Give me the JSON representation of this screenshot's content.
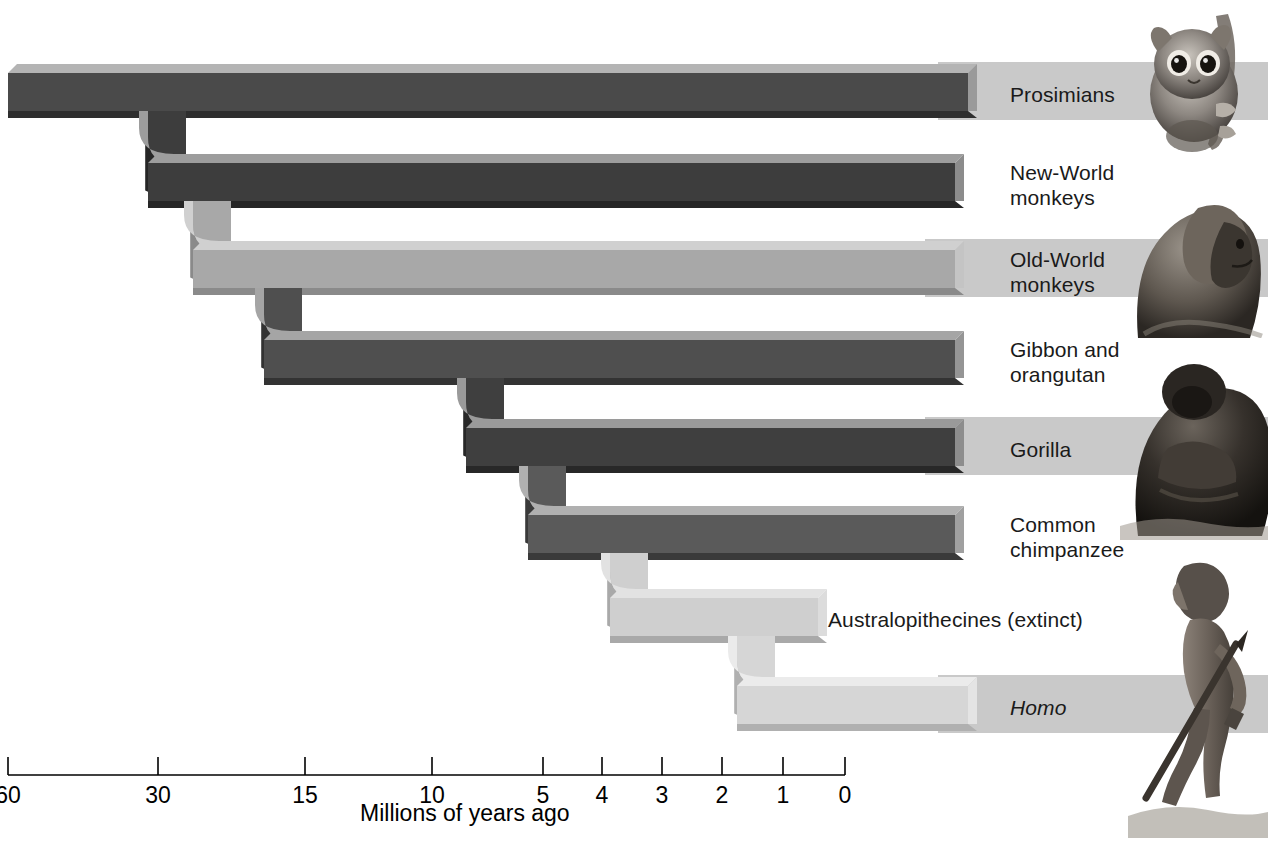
{
  "figure": {
    "axis_title": "Millions of years ago",
    "background": "#ffffff"
  },
  "axis": {
    "label": "Millions of years ago",
    "ticks": [
      {
        "value": "60",
        "x": 8
      },
      {
        "value": "30",
        "x": 158
      },
      {
        "value": "15",
        "x": 305
      },
      {
        "value": "10",
        "x": 432
      },
      {
        "value": "5",
        "x": 543
      },
      {
        "value": "4",
        "x": 602
      },
      {
        "value": "3",
        "x": 662
      },
      {
        "value": "2",
        "x": 722
      },
      {
        "value": "1",
        "x": 783
      },
      {
        "value": "0",
        "x": 845
      }
    ],
    "line_y": 775,
    "tick_top": 757,
    "label_y": 782
  },
  "branches": [
    {
      "id": "prosimians",
      "label": "Prosimians",
      "italic": false,
      "divergence_mya": "60",
      "top": 73,
      "height": 38,
      "start_x": 8,
      "end_x": 968,
      "fill_top": "#b4b4b4",
      "fill_face": "#4a4a4a",
      "fill_bottom": "#2e2e2e",
      "cap": "#9a9a9a",
      "band": true,
      "label_x": 1010,
      "label_y": 82
    },
    {
      "id": "new-world-monkeys",
      "label": "New-World\nmonkeys",
      "italic": false,
      "divergence_mya": "40",
      "top": 163,
      "height": 38,
      "start_x": 148,
      "end_x": 955,
      "fill_top": "#9d9d9d",
      "fill_face": "#3d3d3d",
      "fill_bottom": "#262626",
      "cap": "#8c8c8c",
      "band": false,
      "label_x": 1010,
      "label_y": 160
    },
    {
      "id": "old-world-monkeys",
      "label": "Old-World\nmonkeys",
      "italic": false,
      "divergence_mya": "35",
      "top": 250,
      "height": 38,
      "start_x": 193,
      "end_x": 955,
      "fill_top": "#d0d0d0",
      "fill_face": "#a8a8a8",
      "fill_bottom": "#8a8a8a",
      "cap": "#c4c4c4",
      "band": true,
      "label_x": 1010,
      "label_y": 247
    },
    {
      "id": "gibbon-orangutan",
      "label": "Gibbon and\norangutan",
      "italic": false,
      "divergence_mya": "20",
      "top": 340,
      "height": 38,
      "start_x": 264,
      "end_x": 955,
      "fill_top": "#a5a5a5",
      "fill_face": "#4f4f4f",
      "fill_bottom": "#333333",
      "cap": "#959595",
      "band": false,
      "label_x": 1010,
      "label_y": 337
    },
    {
      "id": "gorilla",
      "label": "Gorilla",
      "italic": false,
      "divergence_mya": "8",
      "top": 428,
      "height": 38,
      "start_x": 466,
      "end_x": 955,
      "fill_top": "#9a9a9a",
      "fill_face": "#3f3f3f",
      "fill_bottom": "#282828",
      "cap": "#8d8d8d",
      "band": true,
      "label_x": 1010,
      "label_y": 437
    },
    {
      "id": "common-chimpanzee",
      "label": "Common\nchimpanzee",
      "italic": false,
      "divergence_mya": "6",
      "top": 515,
      "height": 38,
      "start_x": 528,
      "end_x": 955,
      "fill_top": "#b0b0b0",
      "fill_face": "#5a5a5a",
      "fill_bottom": "#3a3a3a",
      "cap": "#a0a0a0",
      "band": false,
      "label_x": 1010,
      "label_y": 512
    },
    {
      "id": "australopithecines",
      "label": "Australopithecines (extinct)",
      "italic": false,
      "divergence_mya": "4",
      "top": 598,
      "height": 38,
      "start_x": 610,
      "end_x": 818,
      "fill_top": "#e2e2e2",
      "fill_face": "#cfcfcf",
      "fill_bottom": "#a9a9a9",
      "cap": "#dcdcdc",
      "band": false,
      "label_x": 828,
      "label_y": 607
    },
    {
      "id": "homo",
      "label": "Homo",
      "italic": true,
      "divergence_mya": "2.5",
      "top": 686,
      "height": 38,
      "start_x": 737,
      "end_x": 968,
      "fill_top": "#ebebeb",
      "fill_face": "#d6d6d6",
      "fill_bottom": "#b0b0b0",
      "cap": "#e4e4e4",
      "band": true,
      "label_x": 1010,
      "label_y": 695
    }
  ],
  "band": {
    "color": "#c9c9c9",
    "right_edge": 1268
  },
  "illustrations": [
    {
      "id": "tarsier",
      "caption": "tarsier",
      "top": 8,
      "left": 1132,
      "width": 136,
      "height": 148
    },
    {
      "id": "baboon",
      "caption": "baboon",
      "top": 160,
      "left": 1128,
      "width": 140,
      "height": 178
    },
    {
      "id": "gorilla-photo",
      "caption": "gorilla",
      "top": 340,
      "left": 1120,
      "width": 148,
      "height": 200
    },
    {
      "id": "hominid",
      "caption": "early hominid",
      "top": 548,
      "left": 1128,
      "width": 140,
      "height": 290
    }
  ]
}
